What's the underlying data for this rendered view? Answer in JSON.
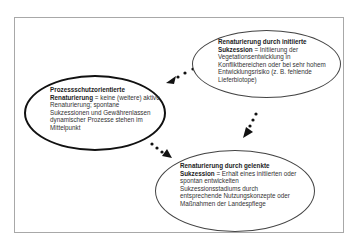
{
  "diagram": {
    "type": "concept-diagram",
    "nodes": [
      {
        "id": "prozessschutz",
        "title": "Prozessschutzorientierte Renaturierung",
        "separator": " = ",
        "description": "keine (weitere) aktive Renaturierung; spontane Sukzessionen und Gewährenlassen dynamischer Prozesse stehen im Mittelpunkt",
        "border": "thick"
      },
      {
        "id": "initiiert",
        "title": "Renaturierung durch initiierte Sukzession",
        "separator": " = ",
        "description": "Initiierung der Vegetationsentwicklung in Konfliktbereichen oder bei sehr hohem Entwicklungsrisiko (z. B. fehlende Lieferbiotope)",
        "border": "thin"
      },
      {
        "id": "gelenkt",
        "title": "Renaturierung durch gelenkte Sukzession",
        "separator": " = ",
        "description": "Erhalt eines initiierten oder spontan entwickelten Sukzessionsstadiums durch entsprechende Nutzungskonzepte oder Maßnahmen der Landespflege",
        "border": "thin"
      }
    ],
    "edges": [
      {
        "from": "initiiert",
        "to": "prozessschutz",
        "style": "dotted-arrow"
      },
      {
        "from": "initiiert",
        "to": "gelenkt",
        "style": "dotted-arrow"
      },
      {
        "from": "prozessschutz",
        "to": "gelenkt",
        "style": "dotted-arrow"
      }
    ]
  }
}
